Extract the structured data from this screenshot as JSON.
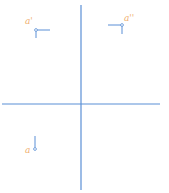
{
  "diagram": {
    "type": "orthographic-projection-axes",
    "colors": {
      "axis": "#5b8fd6",
      "label": "#f0b070",
      "point": "#5b8fd6"
    },
    "labels": {
      "top_left": "a'",
      "top_right": "a''",
      "bottom_left": "a"
    }
  }
}
